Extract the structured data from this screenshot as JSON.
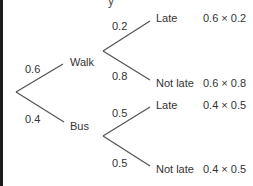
{
  "diagram": {
    "type": "probability-tree",
    "top_fragment": "y",
    "line_color": "#555555",
    "root": {
      "branches": [
        {
          "label": "Walk",
          "probability": "0.6",
          "branches": [
            {
              "label": "Late",
              "probability": "0.2",
              "product": "0.6 × 0.2"
            },
            {
              "label": "Not late",
              "probability": "0.8",
              "product": "0.6 × 0.8"
            }
          ]
        },
        {
          "label": "Bus",
          "probability": "0.4",
          "branches": [
            {
              "label": "Late",
              "probability": "0.5",
              "product": "0.4 × 0.5"
            },
            {
              "label": "Not late",
              "probability": "0.5",
              "product": "0.4 × 0.5"
            }
          ]
        }
      ]
    }
  }
}
